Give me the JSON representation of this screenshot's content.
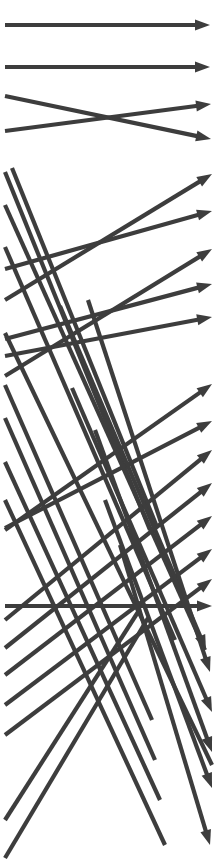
{
  "figure": {
    "width": 218,
    "height": 867,
    "background_color": "#ffffff",
    "stroke_color": "#3d3d3d",
    "stroke_width": 4.2,
    "arrowhead_length": 15,
    "arrowhead_half_width": 5.5,
    "arrow_count": 34
  },
  "arrows": [
    {
      "name": "arrow-01-horizontal-top",
      "x1": 5,
      "y1": 25,
      "x2": 210,
      "y2": 25,
      "head": true
    },
    {
      "name": "arrow-02-horizontal-second",
      "x1": 5,
      "y1": 67,
      "x2": 210,
      "y2": 67,
      "head": true
    },
    {
      "name": "arrow-03-shallow-down",
      "x1": 5,
      "y1": 96,
      "x2": 211,
      "y2": 139,
      "head": true
    },
    {
      "name": "arrow-04-shallow-up",
      "x1": 5,
      "y1": 131,
      "x2": 211,
      "y2": 104,
      "head": true
    },
    {
      "name": "arrow-05-rising-long",
      "x1": 5,
      "y1": 300,
      "x2": 212,
      "y2": 174,
      "head": true
    },
    {
      "name": "arrow-06-rising-mid",
      "x1": 5,
      "y1": 269,
      "x2": 212,
      "y2": 211,
      "head": true
    },
    {
      "name": "arrow-07-rising-steep",
      "x1": 5,
      "y1": 376,
      "x2": 212,
      "y2": 249,
      "head": true
    },
    {
      "name": "arrow-08-rising-shallow",
      "x1": 5,
      "y1": 339,
      "x2": 212,
      "y2": 284,
      "head": true
    },
    {
      "name": "arrow-09-rising-flat",
      "x1": 5,
      "y1": 356,
      "x2": 212,
      "y2": 317,
      "head": true
    },
    {
      "name": "arrow-10-rising-to-380",
      "x1": 5,
      "y1": 530,
      "x2": 212,
      "y2": 384,
      "head": true
    },
    {
      "name": "arrow-11-rising-to-420",
      "x1": 5,
      "y1": 528,
      "x2": 212,
      "y2": 421,
      "head": true
    },
    {
      "name": "arrow-12-rising-to-450",
      "x1": 5,
      "y1": 620,
      "x2": 212,
      "y2": 450,
      "head": true
    },
    {
      "name": "arrow-13-rising-to-482",
      "x1": 5,
      "y1": 648,
      "x2": 212,
      "y2": 483,
      "head": true
    },
    {
      "name": "arrow-14-rising-to-515",
      "x1": 5,
      "y1": 675,
      "x2": 212,
      "y2": 516,
      "head": true
    },
    {
      "name": "arrow-15-rising-to-548",
      "x1": 5,
      "y1": 705,
      "x2": 212,
      "y2": 549,
      "head": true
    },
    {
      "name": "arrow-16-rising-to-578",
      "x1": 5,
      "y1": 735,
      "x2": 212,
      "y2": 579,
      "head": true
    },
    {
      "name": "arrow-17-horizontal-lower",
      "x1": 5,
      "y1": 606,
      "x2": 212,
      "y2": 606,
      "head": true
    },
    {
      "name": "arrow-18-steep-down-upper",
      "x1": 5,
      "y1": 172,
      "x2": 150,
      "y2": 530,
      "head": false
    },
    {
      "name": "arrow-19-steep-down-second",
      "x1": 12,
      "y1": 168,
      "x2": 157,
      "y2": 527,
      "head": false
    },
    {
      "name": "arrow-20-descend-to-right",
      "x1": 5,
      "y1": 205,
      "x2": 205,
      "y2": 650,
      "head": false
    },
    {
      "name": "arrow-21-descend-mid",
      "x1": 5,
      "y1": 247,
      "x2": 175,
      "y2": 640,
      "head": false
    },
    {
      "name": "arrow-22-descend-long",
      "x1": 5,
      "y1": 333,
      "x2": 212,
      "y2": 765,
      "head": false
    },
    {
      "name": "arrow-23-descend-steep-a",
      "x1": 5,
      "y1": 385,
      "x2": 152,
      "y2": 720,
      "head": false
    },
    {
      "name": "arrow-24-descend-steep-b",
      "x1": 5,
      "y1": 418,
      "x2": 155,
      "y2": 760,
      "head": false
    },
    {
      "name": "arrow-25-descend-steep-c",
      "x1": 5,
      "y1": 462,
      "x2": 160,
      "y2": 800,
      "head": false
    },
    {
      "name": "arrow-26-descend-steep-d",
      "x1": 5,
      "y1": 500,
      "x2": 165,
      "y2": 845,
      "head": false
    },
    {
      "name": "arrow-27-down-right-to-head-a",
      "x1": 60,
      "y1": 306,
      "x2": 206,
      "y2": 650,
      "head": true
    },
    {
      "name": "arrow-28-down-right-to-head-b",
      "x1": 88,
      "y1": 300,
      "x2": 210,
      "y2": 672,
      "head": true
    },
    {
      "name": "arrow-29-down-right-to-head-c",
      "x1": 72,
      "y1": 388,
      "x2": 212,
      "y2": 712,
      "head": true
    },
    {
      "name": "arrow-30-down-right-to-head-d",
      "x1": 95,
      "y1": 430,
      "x2": 212,
      "y2": 752,
      "head": true
    },
    {
      "name": "arrow-31-down-right-to-head-e",
      "x1": 105,
      "y1": 500,
      "x2": 212,
      "y2": 788,
      "head": true
    },
    {
      "name": "arrow-32-down-right-to-head-f",
      "x1": 120,
      "y1": 545,
      "x2": 210,
      "y2": 845,
      "head": true
    },
    {
      "name": "arrow-33-up-right-steep",
      "x1": 5,
      "y1": 858,
      "x2": 148,
      "y2": 618,
      "head": false
    },
    {
      "name": "arrow-34-up-right-steep-b",
      "x1": 5,
      "y1": 820,
      "x2": 138,
      "y2": 612,
      "head": false
    }
  ]
}
